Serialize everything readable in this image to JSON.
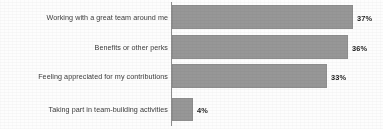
{
  "chart_data": {
    "type": "bar",
    "orientation": "horizontal",
    "title": "",
    "subtitle": "",
    "xlabel": "",
    "ylabel": "",
    "xlim": [
      0,
      40
    ],
    "grid": false,
    "legend": false,
    "value_suffix": "%",
    "bar_color": "#979797",
    "bar_border_color": "#8e8e8e",
    "axis_color": "#8d8d8d",
    "background_color": "#fdfdfd",
    "categories": [
      "Working with a great team around me",
      "Benefits or other perks",
      "Feeling appreciated for my contributions",
      "Taking part in team-building activities"
    ],
    "values": [
      37,
      36,
      33,
      4
    ],
    "value_labels": [
      "37%",
      "36%",
      "33%",
      "4%"
    ]
  },
  "bars": [
    {
      "label": "Working with a great team around me",
      "value_label": "37%",
      "bar_left": 172,
      "bar_top": 5,
      "bar_width": 181,
      "bar_height": 24,
      "label_top": 13,
      "value_left": 357,
      "value_top": 14
    },
    {
      "label": "Benefits or other perks",
      "value_label": "36%",
      "bar_left": 172,
      "bar_top": 35,
      "bar_width": 176,
      "bar_height": 24,
      "label_top": 43,
      "value_left": 352,
      "value_top": 44
    },
    {
      "label": "Feeling appreciated for my contributions",
      "value_label": "33%",
      "bar_left": 172,
      "bar_top": 64,
      "bar_width": 155,
      "bar_height": 24,
      "label_top": 72,
      "value_left": 331,
      "value_top": 73
    },
    {
      "label": "Taking part in team-building activities",
      "value_label": "4%",
      "bar_left": 172,
      "bar_top": 98,
      "bar_width": 21,
      "bar_height": 23,
      "label_top": 105,
      "value_left": 197,
      "value_top": 106
    }
  ]
}
